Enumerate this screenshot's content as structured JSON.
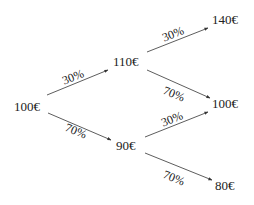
{
  "diagram": {
    "type": "probability-tree",
    "colors": {
      "text": "#222222",
      "edge": "#333333",
      "background": "#ffffff"
    },
    "nodes": {
      "root": "100€",
      "up": "110€",
      "down": "90€",
      "up_up": "140€",
      "middle": "100€",
      "down_down": "80€"
    },
    "edges": {
      "root_up": "30%",
      "root_down": "70%",
      "up_up": "30%",
      "up_middle": "70%",
      "down_middle": "30%",
      "down_down": "70%"
    }
  }
}
